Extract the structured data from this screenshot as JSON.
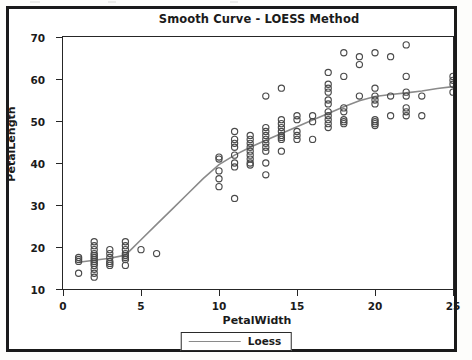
{
  "title": "Smooth Curve - LOESS Method",
  "legend": {
    "label": "Loess"
  },
  "axes": {
    "xlabel": "PetalWidth",
    "ylabel": "PetalLength",
    "xticks": [
      "0",
      "5",
      "10",
      "15",
      "20",
      "25"
    ],
    "yticks": [
      "70",
      "60",
      "50",
      "40",
      "30",
      "20",
      "10"
    ]
  },
  "colors": {
    "curve": "#8a8a8a",
    "marker": "#4a4a4a",
    "axis": "#262626",
    "frame": "#1a1a1a",
    "background": "#ffffff"
  },
  "chart_data": {
    "type": "scatter",
    "title": "Smooth Curve - LOESS Method",
    "xlabel": "PetalWidth",
    "ylabel": "PetalLength",
    "xlim": [
      0,
      25
    ],
    "ylim": [
      7,
      71
    ],
    "xticks": [
      0,
      5,
      10,
      15,
      20,
      25
    ],
    "yticks": [
      10,
      20,
      30,
      40,
      50,
      60,
      70
    ],
    "grid": false,
    "legend_position": "bottom-center",
    "series": [
      {
        "name": "observations",
        "type": "scatter",
        "marker": "open-circle",
        "points": [
          [
            1,
            14
          ],
          [
            1,
            14.5
          ],
          [
            1,
            15
          ],
          [
            1,
            11
          ],
          [
            2,
            19
          ],
          [
            2,
            18
          ],
          [
            2,
            17
          ],
          [
            2,
            16
          ],
          [
            2,
            15.5
          ],
          [
            2,
            15
          ],
          [
            2,
            14.5
          ],
          [
            2,
            14
          ],
          [
            2,
            13.5
          ],
          [
            2,
            13
          ],
          [
            2,
            12
          ],
          [
            2,
            11
          ],
          [
            2,
            10
          ],
          [
            3,
            17
          ],
          [
            3,
            16
          ],
          [
            3,
            15
          ],
          [
            3,
            14
          ],
          [
            3,
            13.5
          ],
          [
            3,
            13
          ],
          [
            4,
            19
          ],
          [
            4,
            18
          ],
          [
            4,
            17
          ],
          [
            4,
            16
          ],
          [
            4,
            15.5
          ],
          [
            4,
            15
          ],
          [
            4,
            14.5
          ],
          [
            4,
            13
          ],
          [
            5,
            17
          ],
          [
            6,
            16
          ],
          [
            10,
            35
          ],
          [
            10,
            33
          ],
          [
            11,
            30
          ],
          [
            10,
            40
          ],
          [
            10,
            40.5
          ],
          [
            10,
            37
          ],
          [
            11,
            38
          ],
          [
            11,
            39
          ],
          [
            11,
            41
          ],
          [
            11,
            45
          ],
          [
            11,
            47
          ],
          [
            11,
            44
          ],
          [
            11,
            43
          ],
          [
            12,
            40
          ],
          [
            12,
            38.5
          ],
          [
            12,
            39
          ],
          [
            12,
            42
          ],
          [
            12,
            43
          ],
          [
            12,
            44
          ],
          [
            12,
            45
          ],
          [
            12,
            46
          ],
          [
            12,
            41
          ],
          [
            13,
            56
          ],
          [
            13,
            48
          ],
          [
            13,
            47
          ],
          [
            13,
            46
          ],
          [
            13,
            45
          ],
          [
            13,
            44
          ],
          [
            13,
            43
          ],
          [
            13,
            42
          ],
          [
            13,
            39
          ],
          [
            13,
            36
          ],
          [
            14,
            47
          ],
          [
            14,
            46
          ],
          [
            14,
            45.5
          ],
          [
            14,
            45
          ],
          [
            14,
            48
          ],
          [
            14,
            49
          ],
          [
            14,
            50
          ],
          [
            14,
            42
          ],
          [
            14,
            58
          ],
          [
            15,
            51
          ],
          [
            15,
            47
          ],
          [
            15,
            46
          ],
          [
            15,
            45
          ],
          [
            15,
            50
          ],
          [
            16,
            45
          ],
          [
            16,
            49.5
          ],
          [
            16,
            51
          ],
          [
            17,
            62
          ],
          [
            17,
            59
          ],
          [
            17,
            58
          ],
          [
            17,
            57
          ],
          [
            17,
            55
          ],
          [
            17,
            54
          ],
          [
            17,
            52
          ],
          [
            17,
            51
          ],
          [
            17,
            50
          ],
          [
            17,
            49
          ],
          [
            17,
            48
          ],
          [
            18,
            61
          ],
          [
            18,
            67
          ],
          [
            18,
            53
          ],
          [
            18,
            52
          ],
          [
            18,
            50
          ],
          [
            18,
            49.5
          ],
          [
            18,
            49
          ],
          [
            19,
            64
          ],
          [
            19,
            66
          ],
          [
            19,
            56
          ],
          [
            20,
            67
          ],
          [
            20,
            58
          ],
          [
            20,
            56
          ],
          [
            20,
            55
          ],
          [
            20,
            54
          ],
          [
            20,
            50
          ],
          [
            20,
            49.5
          ],
          [
            20,
            49
          ],
          [
            20,
            48.5
          ],
          [
            21,
            66
          ],
          [
            21,
            56
          ],
          [
            21,
            51
          ],
          [
            22,
            69
          ],
          [
            22,
            61
          ],
          [
            22,
            57
          ],
          [
            22,
            56
          ],
          [
            22,
            53
          ],
          [
            22,
            52
          ],
          [
            22,
            51
          ],
          [
            23,
            56
          ],
          [
            23,
            51
          ],
          [
            25,
            61
          ],
          [
            25,
            60
          ],
          [
            25,
            59
          ],
          [
            25,
            57
          ]
        ]
      },
      {
        "name": "Loess",
        "type": "line",
        "points": [
          [
            1,
            13.8
          ],
          [
            2,
            14.3
          ],
          [
            3,
            14.8
          ],
          [
            4,
            15.6
          ],
          [
            5,
            19.5
          ],
          [
            6,
            23.4
          ],
          [
            7,
            27.3
          ],
          [
            8,
            31.2
          ],
          [
            9,
            35.1
          ],
          [
            10,
            38.6
          ],
          [
            11,
            41.0
          ],
          [
            12,
            43.0
          ],
          [
            13,
            44.8
          ],
          [
            14,
            46.5
          ],
          [
            15,
            48.2
          ],
          [
            16,
            49.9
          ],
          [
            17,
            51.6
          ],
          [
            18,
            53.3
          ],
          [
            19,
            54.8
          ],
          [
            20,
            55.9
          ],
          [
            21,
            56.4
          ],
          [
            22,
            56.8
          ],
          [
            23,
            57.3
          ],
          [
            24,
            57.9
          ],
          [
            25,
            58.4
          ]
        ]
      }
    ]
  }
}
